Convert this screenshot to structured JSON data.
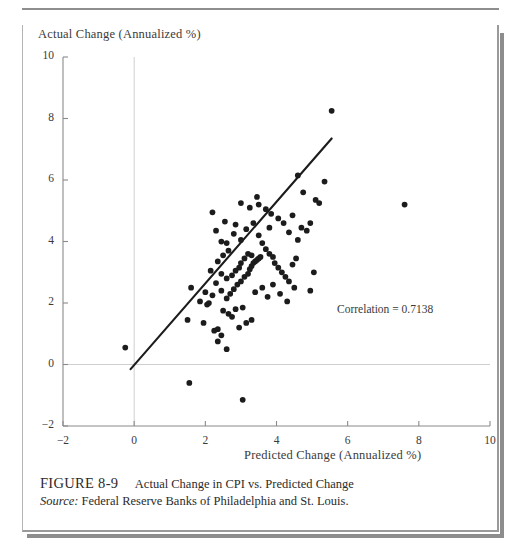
{
  "figure": {
    "number_label": "FIGURE 8-9",
    "title": "Actual Change in CPI vs. Predicted Change",
    "source_label": "Source:",
    "source_text": "Federal Reserve Banks of Philadelphia and St. Louis."
  },
  "annotation": {
    "correlation_text": "Correlation = 0.7138"
  },
  "chart_data": {
    "type": "scatter",
    "title": "Actual Change in CPI vs. Predicted Change",
    "xlabel": "Predicted Change (Annualized %)",
    "ylabel": "Actual Change (Annualized %)",
    "xlim": [
      -2,
      10
    ],
    "ylim": [
      -2,
      10
    ],
    "xticks": [
      -2,
      0,
      2,
      4,
      6,
      8,
      10
    ],
    "yticks": [
      -2,
      0,
      2,
      4,
      6,
      8,
      10
    ],
    "xtick_labels": [
      "−2",
      "0",
      "2",
      "4",
      "6",
      "8",
      "10"
    ],
    "ytick_labels": [
      "−2",
      "0",
      "2",
      "4",
      "6",
      "8",
      "10"
    ],
    "grid": false,
    "zero_line_y": 0,
    "zero_line_x": 0,
    "legend": null,
    "correlation": 0.7138,
    "annotations": [
      {
        "text": "Correlation = 0.7138",
        "x": 5.4,
        "y": 2.45
      }
    ],
    "fit_line": {
      "type": "linear",
      "x_start": -0.1,
      "y_start": -0.15,
      "x_end": 5.55,
      "y_end": 7.35,
      "slope": 1.327,
      "intercept": -0.017
    },
    "marker": {
      "shape": "circle",
      "size": 4.6,
      "color": "#1c1c1c"
    },
    "points": [
      [
        -0.25,
        0.55
      ],
      [
        1.55,
        -0.6
      ],
      [
        3.05,
        -1.15
      ],
      [
        2.6,
        0.5
      ],
      [
        1.5,
        1.45
      ],
      [
        1.95,
        1.35
      ],
      [
        2.25,
        1.1
      ],
      [
        2.35,
        1.15
      ],
      [
        2.05,
        1.95
      ],
      [
        2.1,
        2.0
      ],
      [
        1.6,
        2.5
      ],
      [
        2.45,
        2.4
      ],
      [
        2.5,
        1.75
      ],
      [
        2.65,
        1.65
      ],
      [
        2.75,
        1.55
      ],
      [
        2.95,
        1.2
      ],
      [
        3.15,
        1.35
      ],
      [
        3.3,
        1.45
      ],
      [
        2.85,
        1.8
      ],
      [
        3.05,
        1.85
      ],
      [
        2.6,
        2.15
      ],
      [
        2.7,
        2.3
      ],
      [
        2.8,
        2.45
      ],
      [
        2.9,
        2.6
      ],
      [
        3.0,
        2.7
      ],
      [
        3.1,
        2.85
      ],
      [
        3.2,
        2.95
      ],
      [
        3.25,
        3.1
      ],
      [
        3.3,
        3.2
      ],
      [
        3.35,
        3.3
      ],
      [
        3.4,
        3.35
      ],
      [
        3.45,
        3.4
      ],
      [
        3.5,
        3.45
      ],
      [
        3.55,
        3.5
      ],
      [
        3.3,
        3.55
      ],
      [
        3.2,
        3.6
      ],
      [
        3.1,
        3.45
      ],
      [
        3.0,
        3.3
      ],
      [
        2.95,
        3.15
      ],
      [
        2.85,
        3.05
      ],
      [
        2.75,
        2.9
      ],
      [
        2.6,
        2.8
      ],
      [
        2.45,
        2.95
      ],
      [
        2.3,
        2.65
      ],
      [
        2.2,
        2.25
      ],
      [
        2.0,
        2.35
      ],
      [
        1.85,
        2.05
      ],
      [
        2.15,
        3.05
      ],
      [
        2.35,
        3.35
      ],
      [
        2.5,
        3.55
      ],
      [
        2.65,
        3.7
      ],
      [
        2.45,
        4.0
      ],
      [
        2.3,
        4.35
      ],
      [
        2.8,
        4.25
      ],
      [
        3.0,
        4.05
      ],
      [
        3.15,
        4.4
      ],
      [
        3.35,
        4.6
      ],
      [
        3.5,
        4.2
      ],
      [
        3.6,
        3.95
      ],
      [
        3.7,
        3.75
      ],
      [
        3.8,
        3.6
      ],
      [
        3.9,
        3.5
      ],
      [
        3.95,
        3.3
      ],
      [
        4.05,
        3.15
      ],
      [
        4.15,
        3.0
      ],
      [
        4.25,
        2.85
      ],
      [
        4.35,
        2.7
      ],
      [
        4.45,
        3.25
      ],
      [
        4.55,
        3.45
      ],
      [
        4.6,
        4.05
      ],
      [
        4.35,
        4.3
      ],
      [
        4.2,
        4.6
      ],
      [
        4.05,
        4.75
      ],
      [
        3.85,
        4.9
      ],
      [
        3.7,
        5.05
      ],
      [
        3.5,
        5.2
      ],
      [
        3.25,
        5.1
      ],
      [
        3.0,
        5.25
      ],
      [
        2.85,
        4.55
      ],
      [
        2.55,
        4.65
      ],
      [
        2.2,
        4.95
      ],
      [
        3.4,
        2.35
      ],
      [
        3.6,
        2.5
      ],
      [
        3.75,
        2.2
      ],
      [
        3.9,
        2.6
      ],
      [
        4.1,
        2.3
      ],
      [
        4.3,
        2.05
      ],
      [
        4.5,
        2.5
      ],
      [
        4.7,
        4.45
      ],
      [
        4.85,
        4.35
      ],
      [
        4.95,
        4.6
      ],
      [
        5.1,
        5.35
      ],
      [
        5.2,
        5.25
      ],
      [
        4.75,
        5.6
      ],
      [
        4.6,
        6.15
      ],
      [
        5.35,
        5.95
      ],
      [
        5.55,
        8.25
      ],
      [
        7.6,
        5.2
      ],
      [
        5.05,
        3.0
      ],
      [
        4.95,
        2.4
      ],
      [
        3.45,
        5.45
      ],
      [
        2.45,
        0.95
      ],
      [
        2.35,
        0.75
      ],
      [
        2.6,
        3.95
      ],
      [
        3.8,
        4.45
      ],
      [
        4.45,
        4.85
      ]
    ]
  }
}
